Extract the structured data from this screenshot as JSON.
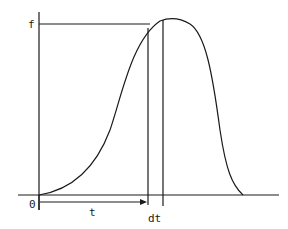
{
  "diagram": {
    "labels": {
      "f": "f",
      "origin": "0",
      "t": "t",
      "dt": "dt"
    },
    "colors": {
      "ink": "#1a1a1a",
      "background": "#ffffff"
    }
  }
}
